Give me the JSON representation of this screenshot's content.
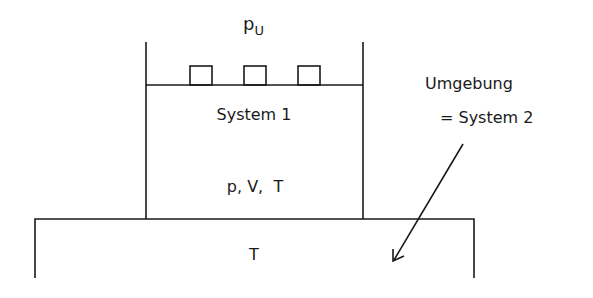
{
  "diagram": {
    "type": "thermodynamic-system",
    "labels": {
      "ambient_pressure": "p",
      "ambient_pressure_sub": "U",
      "system1": "System 1",
      "state_vars": "p, V,  T",
      "reservoir_temp": "T",
      "surroundings_line1": "Umgebung",
      "surroundings_line2": "= System 2"
    },
    "weights_count": 3,
    "colors": {
      "stroke": "#1a1a1a",
      "background": "#ffffff"
    }
  }
}
